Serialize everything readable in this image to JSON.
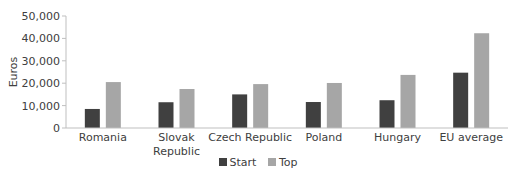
{
  "chart_data": {
    "type": "bar",
    "title": "",
    "xlabel": "",
    "ylabel": "Euros",
    "ylim": [
      0,
      50000
    ],
    "yticks": [
      0,
      10000,
      20000,
      30000,
      40000,
      50000
    ],
    "ytick_labels": [
      "0",
      "10,000",
      "20,000",
      "30,000",
      "40,000",
      "50,000"
    ],
    "categories": [
      "Romania",
      "Slovak Republic",
      "Czech Republic",
      "Poland",
      "Hungary",
      "EU average"
    ],
    "category_lines": [
      [
        "Romania"
      ],
      [
        "Slovak",
        "Republic"
      ],
      [
        "Czech Republic"
      ],
      [
        "Poland"
      ],
      [
        "Hungary"
      ],
      [
        "EU average"
      ]
    ],
    "series": [
      {
        "name": "Start",
        "color": "#404040",
        "values": [
          8500,
          11500,
          15000,
          11600,
          12400,
          24700
        ]
      },
      {
        "name": "Top",
        "color": "#a6a6a6",
        "values": [
          20500,
          17400,
          19600,
          20100,
          23700,
          42300
        ]
      }
    ],
    "grid": false,
    "legend_position": "bottom"
  },
  "legend": {
    "items": [
      {
        "label": "Start",
        "color": "#404040"
      },
      {
        "label": "Top",
        "color": "#a6a6a6"
      }
    ]
  }
}
